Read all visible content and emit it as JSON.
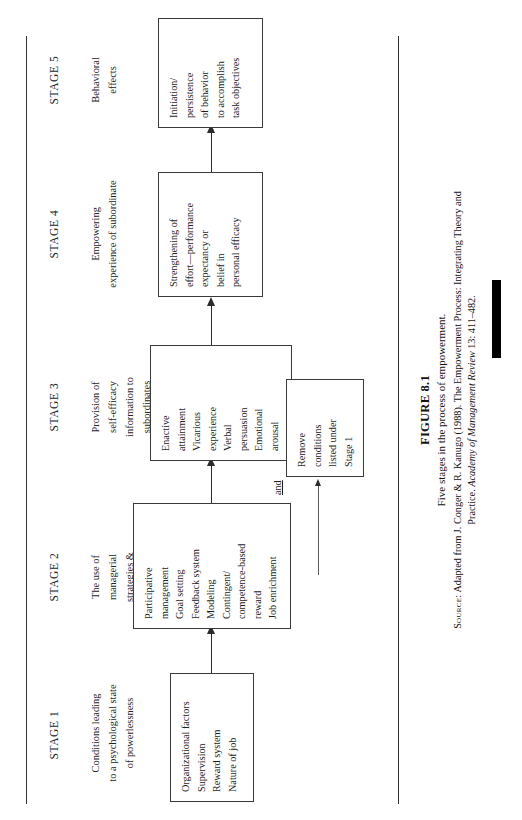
{
  "figure": {
    "number": "FIGURE 8.1",
    "description": "Five stages in the process of empowerment.",
    "source_label": "Source:",
    "source_text_1": "Adapted from J. Conger & R. Kanugo (1988). The Empowerment Process: Integrating Theory and",
    "source_text_2_pre": "Practice.",
    "source_text_2_italic": "Academy of Management Review",
    "source_text_2_post": "13: 411–482."
  },
  "stages": [
    {
      "id": "stage-1",
      "header": "STAGE 1",
      "subtitle": [
        "Conditions leading",
        "to a psychological state",
        "of powerlessness"
      ],
      "box": {
        "id": "box-stage-1",
        "lines": [
          "Organizational factors",
          "Supervision",
          "Reward system",
          "Nature of job"
        ]
      }
    },
    {
      "id": "stage-2",
      "header": "STAGE 2",
      "subtitle": [
        "The use of",
        "managerial",
        "strategies &",
        "techniques"
      ],
      "box": {
        "id": "box-stage-2",
        "lines": [
          "Participative",
          "management",
          "Goal setting",
          "Feedback system",
          "Modeling",
          "Contingent/",
          "competence-based",
          "reward",
          "Job enrichment"
        ]
      }
    },
    {
      "id": "stage-3",
      "header": "STAGE 3",
      "subtitle": [
        "Provision of",
        "self-efficacy",
        "information to",
        "subordinates",
        "using four sources"
      ],
      "box": {
        "id": "box-stage-3",
        "lines": [
          "Enactive",
          "attainment",
          "Vicarious",
          "experience",
          "Verbal",
          "persuasion",
          "Emotional",
          "arousal"
        ]
      }
    },
    {
      "id": "stage-4",
      "header": "STAGE 4",
      "subtitle": [
        "Empowering",
        "experience of subordinate"
      ],
      "box": {
        "id": "box-stage-4",
        "lines": [
          "Strengthening of",
          "effort—performance",
          "expectancy or",
          "belief in",
          "personal efficacy"
        ]
      }
    },
    {
      "id": "stage-5",
      "header": "STAGE 5",
      "subtitle": [
        "Behavioral",
        "effects"
      ],
      "box": {
        "id": "box-stage-5",
        "lines": [
          "Initiation/",
          "persistence",
          "of behavior",
          "to accomplish",
          "task objectives"
        ]
      }
    }
  ],
  "secondary": {
    "connector_label": "and",
    "box": {
      "id": "box-remove-conditions",
      "lines": [
        "Remove",
        "conditions",
        "listed under",
        "Stage 1"
      ]
    }
  }
}
